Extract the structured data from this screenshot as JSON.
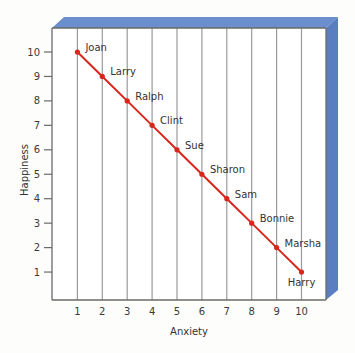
{
  "chart_data": {
    "type": "line",
    "title": "",
    "xlabel": "Anxiety",
    "ylabel": "Happiness",
    "xlim": [
      0,
      11
    ],
    "ylim": [
      0,
      10.8
    ],
    "x_ticks": [
      1,
      2,
      3,
      4,
      5,
      6,
      7,
      8,
      9,
      10
    ],
    "y_ticks": [
      1,
      2,
      3,
      4,
      5,
      6,
      7,
      8,
      9,
      10
    ],
    "grid": "vertical",
    "colors": {
      "line": "#d8261c",
      "frame": "#6a8fcc",
      "frame_side": "#5a7ec0",
      "gridline": "#9a9a9a",
      "axis": "#6a6a6a"
    },
    "series": [
      {
        "name": "people",
        "points": [
          {
            "label": "Joan",
            "x": 1,
            "y": 10
          },
          {
            "label": "Larry",
            "x": 2,
            "y": 9
          },
          {
            "label": "Ralph",
            "x": 3,
            "y": 8
          },
          {
            "label": "Clint",
            "x": 4,
            "y": 7
          },
          {
            "label": "Sue",
            "x": 5,
            "y": 6
          },
          {
            "label": "Sharon",
            "x": 6,
            "y": 5
          },
          {
            "label": "Sam",
            "x": 7,
            "y": 4
          },
          {
            "label": "Bonnie",
            "x": 8,
            "y": 3
          },
          {
            "label": "Marsha",
            "x": 9,
            "y": 2
          },
          {
            "label": "Harry",
            "x": 10,
            "y": 1
          }
        ]
      }
    ]
  }
}
